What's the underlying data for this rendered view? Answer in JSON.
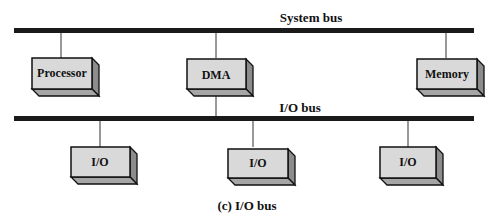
{
  "diagram": {
    "caption": "(c) I/O bus",
    "system_bus": {
      "label": "System bus"
    },
    "io_bus": {
      "label": "I/O bus"
    },
    "modules": [
      {
        "id": "processor",
        "label": "Processor",
        "bus": "system"
      },
      {
        "id": "dma",
        "label": "DMA",
        "bus": "system+io"
      },
      {
        "id": "memory",
        "label": "Memory",
        "bus": "system"
      }
    ],
    "io_modules": [
      {
        "id": "io1",
        "label": "I/O"
      },
      {
        "id": "io2",
        "label": "I/O"
      },
      {
        "id": "io3",
        "label": "I/O"
      }
    ],
    "colors": {
      "bus": "#1a1a1a",
      "box_front": "#d9d9d9",
      "box_side": "#8c8c8c",
      "box_bottom": "#a6a6a6",
      "line": "#333333"
    }
  }
}
